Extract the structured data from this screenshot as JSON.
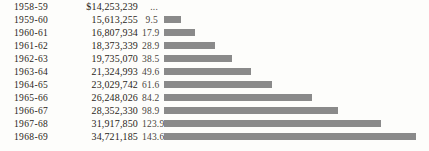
{
  "chart_data": {
    "type": "bar",
    "title": "",
    "xlabel": "",
    "ylabel": "",
    "categories": [
      "1958-59",
      "1959-60",
      "1960-61",
      "1961-62",
      "1962-63",
      "1963-64",
      "1964-65",
      "1965-66",
      "1966-67",
      "1967-68",
      "1968-69"
    ],
    "values": [
      null,
      9.5,
      17.9,
      28.9,
      38.5,
      49.6,
      61.6,
      84.2,
      98.9,
      123.9,
      143.6
    ],
    "amounts": [
      "$14,253,239",
      "15,613,255",
      "16,807,934",
      "18,373,339",
      "19,735,070",
      "21,324,993",
      "23,029,742",
      "26,248,026",
      "28,352,330",
      "31,917,850",
      "34,721,185"
    ],
    "percent_labels": [
      "...",
      "9.5",
      "17.9",
      "28.9",
      "38.5",
      "49.6",
      "61.6",
      "84.2",
      "98.9",
      "123.9",
      "143.6"
    ],
    "xlim": [
      0,
      143.6
    ],
    "grid": false,
    "legend": "none",
    "orientation": "horizontal",
    "bar_color": "#8a8a8a"
  },
  "table": {
    "rows": [
      {
        "year": "1958-59",
        "amount": "$14,253,239",
        "percent": "...",
        "value": null
      },
      {
        "year": "1959-60",
        "amount": "15,613,255",
        "percent": "9.5",
        "value": 9.5
      },
      {
        "year": "1960-61",
        "amount": "16,807,934",
        "percent": "17.9",
        "value": 17.9
      },
      {
        "year": "1961-62",
        "amount": "18,373,339",
        "percent": "28.9",
        "value": 28.9
      },
      {
        "year": "1962-63",
        "amount": "19,735,070",
        "percent": "38.5",
        "value": 38.5
      },
      {
        "year": "1963-64",
        "amount": "21,324,993",
        "percent": "49.6",
        "value": 49.6
      },
      {
        "year": "1964-65",
        "amount": "23,029,742",
        "percent": "61.6",
        "value": 61.6
      },
      {
        "year": "1965-66",
        "amount": "26,248,026",
        "percent": "84.2",
        "value": 84.2
      },
      {
        "year": "1966-67",
        "amount": "28,352,330",
        "percent": "98.9",
        "value": 98.9
      },
      {
        "year": "1967-68",
        "amount": "31,917,850",
        "percent": "123.9",
        "value": 123.9
      },
      {
        "year": "1968-69",
        "amount": "34,721,185",
        "percent": "143.6",
        "value": 143.6
      }
    ]
  }
}
